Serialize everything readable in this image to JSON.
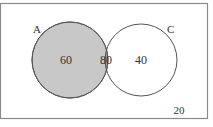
{
  "diagram": {
    "type": "venn",
    "sets": [
      {
        "label": "A",
        "only_value": "60",
        "fill": "#c8c8c8"
      },
      {
        "label": "C",
        "only_value": "40",
        "fill": "#ffffff"
      }
    ],
    "intersection": {
      "value": "80",
      "fill": "#9a9a9a"
    },
    "outside": {
      "value": "20"
    },
    "colors": {
      "border": "#8a8a8a",
      "stroke": "#555555",
      "text": "#333333"
    }
  }
}
